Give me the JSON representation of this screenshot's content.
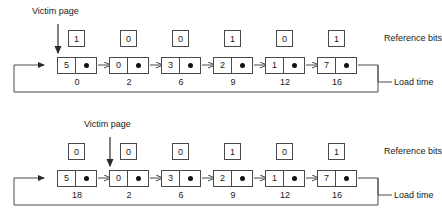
{
  "figure": {
    "line_color": "#4a4a4a",
    "dot_color": "#111111",
    "background": "#ffffff"
  },
  "labels": {
    "victim_page": "Victim page",
    "reference_bits": "Reference bits",
    "load_time": "Load time"
  },
  "diagrams": [
    {
      "id": "before",
      "caption": "Circular queue of pages before replacement",
      "victim_index": 0,
      "reference_bits": [
        "1",
        "0",
        "0",
        "1",
        "0",
        "1"
      ],
      "nodes": [
        {
          "page": "5",
          "load_time": "0"
        },
        {
          "page": "0",
          "load_time": "2"
        },
        {
          "page": "3",
          "load_time": "6"
        },
        {
          "page": "2",
          "load_time": "9"
        },
        {
          "page": "1",
          "load_time": "12"
        },
        {
          "page": "7",
          "load_time": "16"
        }
      ]
    },
    {
      "id": "after",
      "caption": "Circular queue of pages after replacement",
      "victim_index": 1,
      "reference_bits": [
        "0",
        "0",
        "0",
        "1",
        "0",
        "1"
      ],
      "nodes": [
        {
          "page": "5",
          "load_time": "18"
        },
        {
          "page": "0",
          "load_time": "2"
        },
        {
          "page": "3",
          "load_time": "6"
        },
        {
          "page": "2",
          "load_time": "9"
        },
        {
          "page": "1",
          "load_time": "12"
        },
        {
          "page": "7",
          "load_time": "16"
        }
      ]
    }
  ]
}
